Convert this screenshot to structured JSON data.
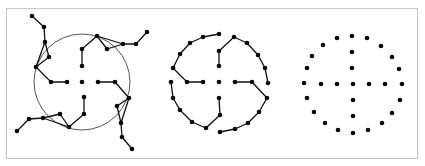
{
  "figure": {
    "colors": {
      "node": "#0a0a0a",
      "edge": "#111111",
      "ring": "#555555",
      "frame": "#c8c8c8",
      "background": "#ffffff"
    },
    "panels": [
      {
        "id": "panel-left",
        "has_ring": true,
        "nodes": [
          [
            32,
            16
          ],
          [
            44,
            27
          ],
          [
            45,
            42
          ],
          [
            49,
            57
          ],
          [
            36,
            67
          ],
          [
            51,
            82
          ],
          [
            67,
            82
          ],
          [
            82,
            82
          ],
          [
            97,
            36
          ],
          [
            82,
            49
          ],
          [
            82,
            66
          ],
          [
            107,
            49
          ],
          [
            123,
            44
          ],
          [
            136,
            44
          ],
          [
            147,
            32
          ],
          [
            98,
            82
          ],
          [
            115,
            82
          ],
          [
            129,
            98
          ],
          [
            117,
            106
          ],
          [
            121,
            123
          ],
          [
            122,
            137
          ],
          [
            132,
            149
          ],
          [
            84,
            97
          ],
          [
            84,
            114
          ],
          [
            69,
            127
          ],
          [
            60,
            114
          ],
          [
            43,
            118
          ],
          [
            29,
            119
          ],
          [
            17,
            131
          ]
        ],
        "edges": [
          [
            0,
            1
          ],
          [
            1,
            2
          ],
          [
            2,
            3
          ],
          [
            3,
            4
          ],
          [
            2,
            4
          ],
          [
            4,
            5
          ],
          [
            5,
            6
          ],
          [
            8,
            9
          ],
          [
            9,
            10
          ],
          [
            8,
            11
          ],
          [
            11,
            12
          ],
          [
            8,
            12
          ],
          [
            12,
            13
          ],
          [
            13,
            14
          ],
          [
            15,
            16
          ],
          [
            16,
            17
          ],
          [
            17,
            18
          ],
          [
            18,
            19
          ],
          [
            17,
            19
          ],
          [
            19,
            20
          ],
          [
            20,
            21
          ],
          [
            22,
            23
          ],
          [
            23,
            24
          ],
          [
            24,
            25
          ],
          [
            25,
            26
          ],
          [
            24,
            26
          ],
          [
            26,
            27
          ],
          [
            27,
            28
          ]
        ]
      },
      {
        "id": "panel-middle",
        "has_ring": false,
        "nodes": [
          [
            219,
            34
          ],
          [
            203,
            37
          ],
          [
            190,
            43
          ],
          [
            180,
            54
          ],
          [
            173,
            68
          ],
          [
            187,
            82
          ],
          [
            203,
            82
          ],
          [
            219,
            82
          ],
          [
            234,
            37
          ],
          [
            219,
            51
          ],
          [
            219,
            66
          ],
          [
            247,
            43
          ],
          [
            258,
            55
          ],
          [
            265,
            68
          ],
          [
            268,
            83
          ],
          [
            235,
            82
          ],
          [
            252,
            82
          ],
          [
            267,
            98
          ],
          [
            259,
            112
          ],
          [
            248,
            123
          ],
          [
            235,
            129
          ],
          [
            220,
            132
          ],
          [
            219,
            98
          ],
          [
            220,
            115
          ],
          [
            206,
            128
          ],
          [
            192,
            122
          ],
          [
            180,
            110
          ],
          [
            173,
            98
          ],
          [
            171,
            82
          ]
        ],
        "edges": [
          [
            0,
            1
          ],
          [
            1,
            2
          ],
          [
            2,
            3
          ],
          [
            3,
            4
          ],
          [
            4,
            5
          ],
          [
            5,
            6
          ],
          [
            8,
            9
          ],
          [
            9,
            10
          ],
          [
            8,
            11
          ],
          [
            11,
            12
          ],
          [
            12,
            13
          ],
          [
            13,
            14
          ],
          [
            15,
            16
          ],
          [
            16,
            17
          ],
          [
            17,
            18
          ],
          [
            18,
            19
          ],
          [
            19,
            20
          ],
          [
            20,
            21
          ],
          [
            22,
            23
          ],
          [
            23,
            24
          ],
          [
            24,
            25
          ],
          [
            25,
            26
          ],
          [
            26,
            27
          ],
          [
            27,
            28
          ]
        ]
      },
      {
        "id": "panel-right",
        "has_ring": false,
        "nodes": [
          [
            352,
            36
          ],
          [
            367,
            38
          ],
          [
            381,
            46
          ],
          [
            392,
            57
          ],
          [
            399,
            69
          ],
          [
            402,
            84
          ],
          [
            400,
            100
          ],
          [
            392,
            113
          ],
          [
            382,
            123
          ],
          [
            368,
            130
          ],
          [
            353,
            133
          ],
          [
            338,
            130
          ],
          [
            325,
            123
          ],
          [
            314,
            112
          ],
          [
            307,
            98
          ],
          [
            304,
            83
          ],
          [
            307,
            68
          ],
          [
            312,
            56
          ],
          [
            323,
            45
          ],
          [
            337,
            38
          ],
          [
            352,
            52
          ],
          [
            352,
            68
          ],
          [
            353,
            84
          ],
          [
            353,
            100
          ],
          [
            353,
            116
          ],
          [
            321,
            84
          ],
          [
            337,
            84
          ],
          [
            369,
            84
          ],
          [
            385,
            84
          ]
        ],
        "edges": []
      }
    ],
    "ring": {
      "cx": 82,
      "cy": 82,
      "r": 48
    }
  }
}
